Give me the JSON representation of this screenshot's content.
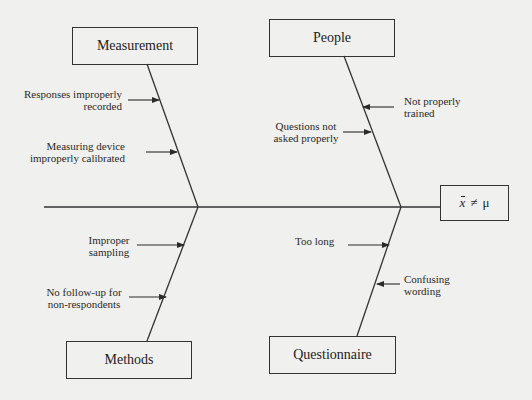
{
  "diagram": {
    "type": "fishbone",
    "effect": {
      "symbol_left": "x",
      "operator": "≠",
      "symbol_right": "μ",
      "label": "x̄ ≠ μ"
    },
    "categories": [
      {
        "name": "Measurement",
        "position": "top-left",
        "causes": [
          "Responses improperly\nrecorded",
          "Measuring device\nimproperly calibrated"
        ]
      },
      {
        "name": "People",
        "position": "top-right",
        "causes": [
          "Not properly\ntrained",
          "Questions not\nasked properly"
        ]
      },
      {
        "name": "Methods",
        "position": "bottom-left",
        "causes": [
          "Improper\nsampling",
          "No follow-up for\nnon-respondents"
        ]
      },
      {
        "name": "Questionnaire",
        "position": "bottom-right",
        "causes": [
          "Too long",
          "Confusing\nwording"
        ]
      }
    ],
    "colors": {
      "background": "#f0f0ee",
      "lines": "#333333",
      "text": "#222222"
    }
  }
}
